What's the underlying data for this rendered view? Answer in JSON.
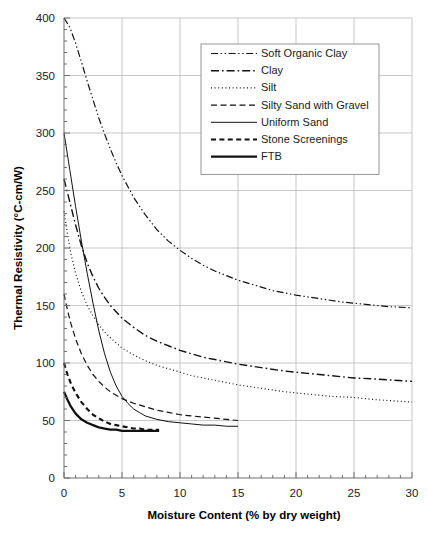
{
  "chart_data": {
    "type": "line",
    "title": "",
    "xlabel": "Moisture Content (% by dry weight)",
    "ylabel": "Thermal Resistivity (°C-cm/W)",
    "xlim": [
      0,
      30
    ],
    "ylim": [
      0,
      400
    ],
    "xticks": [
      0,
      5,
      10,
      15,
      20,
      25,
      30
    ],
    "yticks": [
      0,
      50,
      100,
      150,
      200,
      250,
      300,
      350,
      400
    ],
    "xtick_labels": [
      "0",
      "5",
      "10",
      "15",
      "20",
      "25",
      "30"
    ],
    "ytick_labels": [
      "0",
      "50",
      "100",
      "150",
      "200",
      "250",
      "300",
      "350",
      "400"
    ],
    "x_minor_step": 1,
    "y_minor_step": 10,
    "grid": true,
    "legend_position": "upper-center-right",
    "series": [
      {
        "name": "Soft Organic Clay",
        "dash": "dash-dot-dot",
        "width": 1.2,
        "color": "#111111",
        "points": [
          [
            0,
            400
          ],
          [
            0.5,
            392
          ],
          [
            1,
            378
          ],
          [
            1.5,
            362
          ],
          [
            2,
            345
          ],
          [
            2.5,
            329
          ],
          [
            3,
            313
          ],
          [
            3.5,
            299
          ],
          [
            4,
            286
          ],
          [
            4.5,
            274
          ],
          [
            5,
            263
          ],
          [
            6,
            244
          ],
          [
            7,
            229
          ],
          [
            8,
            216
          ],
          [
            9,
            206
          ],
          [
            10,
            198
          ],
          [
            11,
            191
          ],
          [
            12,
            185
          ],
          [
            13,
            180
          ],
          [
            14,
            176
          ],
          [
            15,
            172
          ],
          [
            16,
            169
          ],
          [
            17,
            166
          ],
          [
            18,
            163
          ],
          [
            19,
            161
          ],
          [
            20,
            159
          ],
          [
            22,
            156
          ],
          [
            24,
            153
          ],
          [
            26,
            151
          ],
          [
            28,
            149
          ],
          [
            30,
            148
          ]
        ]
      },
      {
        "name": "Clay",
        "dash": "dash-dot",
        "width": 1.4,
        "color": "#111111",
        "points": [
          [
            0,
            260
          ],
          [
            0.3,
            248
          ],
          [
            0.7,
            232
          ],
          [
            1,
            220
          ],
          [
            1.5,
            202
          ],
          [
            2,
            187
          ],
          [
            2.5,
            175
          ],
          [
            3,
            165
          ],
          [
            3.5,
            157
          ],
          [
            4,
            150
          ],
          [
            5,
            139
          ],
          [
            6,
            131
          ],
          [
            7,
            124
          ],
          [
            8,
            119
          ],
          [
            9,
            115
          ],
          [
            10,
            111
          ],
          [
            11,
            108
          ],
          [
            12,
            105
          ],
          [
            13,
            103
          ],
          [
            14,
            101
          ],
          [
            15,
            99
          ],
          [
            17,
            96
          ],
          [
            19,
            93
          ],
          [
            21,
            91
          ],
          [
            23,
            89
          ],
          [
            25,
            87
          ],
          [
            27,
            86
          ],
          [
            30,
            84
          ]
        ]
      },
      {
        "name": "Silt",
        "dash": "dotted",
        "width": 1.2,
        "color": "#111111",
        "points": [
          [
            0,
            232
          ],
          [
            0.3,
            212
          ],
          [
            0.6,
            195
          ],
          [
            1,
            178
          ],
          [
            1.5,
            162
          ],
          [
            2,
            150
          ],
          [
            2.5,
            141
          ],
          [
            3,
            133
          ],
          [
            3.5,
            127
          ],
          [
            4,
            122
          ],
          [
            5,
            113
          ],
          [
            6,
            107
          ],
          [
            7,
            102
          ],
          [
            8,
            98
          ],
          [
            9,
            95
          ],
          [
            10,
            92
          ],
          [
            11,
            89
          ],
          [
            12,
            87
          ],
          [
            13,
            85
          ],
          [
            14,
            83
          ],
          [
            15,
            81
          ],
          [
            17,
            78
          ],
          [
            19,
            75
          ],
          [
            21,
            73
          ],
          [
            23,
            71
          ],
          [
            25,
            70
          ],
          [
            27,
            68
          ],
          [
            30,
            66
          ]
        ]
      },
      {
        "name": "Silty Sand with Gravel",
        "dash": "dashed",
        "width": 1.2,
        "color": "#111111",
        "points": [
          [
            0,
            160
          ],
          [
            0.3,
            146
          ],
          [
            0.6,
            134
          ],
          [
            1,
            121
          ],
          [
            1.5,
            108
          ],
          [
            2,
            98
          ],
          [
            2.5,
            90
          ],
          [
            3,
            84
          ],
          [
            3.5,
            79
          ],
          [
            4,
            75
          ],
          [
            5,
            69
          ],
          [
            6,
            65
          ],
          [
            7,
            62
          ],
          [
            8,
            59
          ],
          [
            9,
            57
          ],
          [
            10,
            55
          ],
          [
            11,
            54
          ],
          [
            12,
            53
          ],
          [
            13,
            52
          ],
          [
            14,
            51
          ],
          [
            15,
            50
          ]
        ]
      },
      {
        "name": "Uniform Sand",
        "dash": "solid",
        "width": 1.0,
        "color": "#111111",
        "points": [
          [
            0,
            300
          ],
          [
            0.5,
            268
          ],
          [
            1,
            236
          ],
          [
            1.5,
            206
          ],
          [
            2,
            178
          ],
          [
            2.5,
            152
          ],
          [
            3,
            128
          ],
          [
            3.5,
            108
          ],
          [
            4,
            92
          ],
          [
            4.5,
            80
          ],
          [
            5,
            71
          ],
          [
            5.5,
            65
          ],
          [
            6,
            60
          ],
          [
            6.5,
            57
          ],
          [
            7,
            54
          ],
          [
            8,
            51
          ],
          [
            9,
            49
          ],
          [
            10,
            48
          ],
          [
            11,
            47
          ],
          [
            12,
            46
          ],
          [
            13,
            46
          ],
          [
            14,
            45
          ],
          [
            15,
            45
          ]
        ]
      },
      {
        "name": "Stone Screenings",
        "dash": "thick-dashed",
        "width": 2.1,
        "color": "#111111",
        "points": [
          [
            0,
            100
          ],
          [
            0.3,
            90
          ],
          [
            0.6,
            82
          ],
          [
            1,
            74
          ],
          [
            1.5,
            66
          ],
          [
            2,
            60
          ],
          [
            2.5,
            55
          ],
          [
            3,
            52
          ],
          [
            3.5,
            49
          ],
          [
            4,
            47
          ],
          [
            4.5,
            46
          ],
          [
            5,
            45
          ],
          [
            5.5,
            44
          ],
          [
            6,
            43
          ],
          [
            6.5,
            43
          ],
          [
            7,
            42
          ],
          [
            7.5,
            42
          ],
          [
            8.2,
            42
          ]
        ]
      },
      {
        "name": "FTB",
        "dash": "thick-solid",
        "width": 2.3,
        "color": "#111111",
        "points": [
          [
            0,
            75
          ],
          [
            0.3,
            68
          ],
          [
            0.6,
            62
          ],
          [
            1,
            56
          ],
          [
            1.5,
            51
          ],
          [
            2,
            48
          ],
          [
            2.5,
            46
          ],
          [
            3,
            44
          ],
          [
            3.5,
            43
          ],
          [
            4,
            42
          ],
          [
            4.5,
            42
          ],
          [
            5,
            41
          ],
          [
            6,
            41
          ],
          [
            7,
            41
          ],
          [
            8.2,
            41
          ]
        ]
      }
    ]
  }
}
